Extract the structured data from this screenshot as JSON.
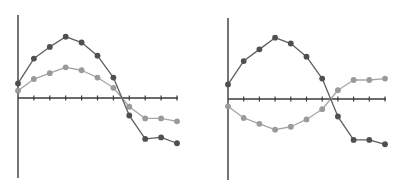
{
  "colors": {
    "background": "#ffffff",
    "axis": "#3a3a3a",
    "dark_series": "#4f4f4f",
    "dark_line": "#5e5e5e",
    "light_series": "#9a9a9a",
    "light_line": "#a6a6a6"
  },
  "chart_data": [
    {
      "type": "line",
      "title": "",
      "xlabel": "",
      "ylabel": "",
      "grid": false,
      "legend": null,
      "x": [
        0,
        1,
        2,
        3,
        4,
        5,
        6,
        7,
        8,
        9,
        10
      ],
      "series": [
        {
          "name": "dark",
          "values": [
            1.0,
            2.7,
            3.5,
            4.2,
            3.8,
            2.9,
            1.4,
            -1.2,
            -2.8,
            -2.7,
            -3.1
          ]
        },
        {
          "name": "light",
          "values": [
            0.5,
            1.3,
            1.7,
            2.1,
            1.9,
            1.4,
            0.7,
            -0.6,
            -1.4,
            -1.4,
            -1.6
          ]
        }
      ],
      "ylim": [
        -5.5,
        5.5
      ],
      "layout": {
        "origin_px": [
          18,
          98
        ],
        "x_step_px": 15.9,
        "y_unit_px": 14.6,
        "x_end_px": 178,
        "y_top_px": 15,
        "y_bottom_px": 178
      }
    },
    {
      "type": "line",
      "title": "",
      "xlabel": "",
      "ylabel": "",
      "grid": false,
      "legend": null,
      "x": [
        0,
        1,
        2,
        3,
        4,
        5,
        6,
        7,
        8,
        9,
        10
      ],
      "series": [
        {
          "name": "dark",
          "values": [
            1.0,
            2.6,
            3.4,
            4.2,
            3.8,
            2.9,
            1.4,
            -1.2,
            -2.8,
            -2.8,
            -3.1
          ]
        },
        {
          "name": "light",
          "values": [
            -0.5,
            -1.3,
            -1.7,
            -2.1,
            -1.9,
            -1.4,
            -0.7,
            0.6,
            1.3,
            1.3,
            1.4
          ]
        }
      ],
      "ylim": [
        -5.5,
        5.5
      ],
      "layout": {
        "origin_px": [
          228,
          99
        ],
        "x_step_px": 15.7,
        "y_unit_px": 14.6,
        "x_end_px": 386,
        "y_top_px": 18,
        "y_bottom_px": 180
      }
    }
  ]
}
